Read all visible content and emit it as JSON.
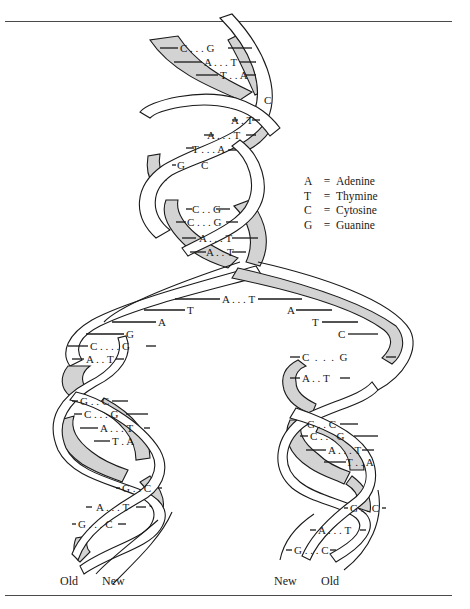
{
  "figure": {
    "colors": {
      "ribbon_fill": "#d3d3d3",
      "stroke": "#1a1a1a",
      "rule": "#4a4a4a"
    }
  },
  "legend": [
    {
      "key": "A",
      "eq": "=",
      "value": "Adenine"
    },
    {
      "key": "T",
      "eq": "=",
      "value": "Thymine"
    },
    {
      "key": "C",
      "eq": "=",
      "value": "Cytosine"
    },
    {
      "key": "G",
      "eq": "=",
      "value": "Guanine"
    }
  ],
  "parent_helix": {
    "pairs": [
      "C . . . G",
      "A . . . T",
      "T . . A",
      "C",
      "A . T",
      "A . . . T",
      "T . . . A",
      "G",
      "C",
      "C . . G",
      "C . . . G",
      "A . . . T",
      "A . . T"
    ]
  },
  "fork": {
    "pair": "A . . . T",
    "left_bases": [
      "T",
      "A",
      "G"
    ],
    "right_bases": [
      "A",
      "T",
      "C"
    ]
  },
  "left_daughter": {
    "pairs": [
      "C . . . . G",
      "A . . T",
      "G . . C",
      "C . . . G",
      "A . . . T",
      "T . A",
      "G . . C",
      "A . . . T",
      "G . . . C"
    ]
  },
  "right_daughter": {
    "pairs": [
      "C  .  .  .  G",
      "A . . T",
      "G . . C",
      "C . . . G",
      "A . . . T",
      "T . . A",
      "G . . C",
      "A . . . T",
      "G . . . C"
    ]
  },
  "strand_labels": {
    "left": [
      "Old",
      "New"
    ],
    "right": [
      "New",
      "Old"
    ]
  }
}
